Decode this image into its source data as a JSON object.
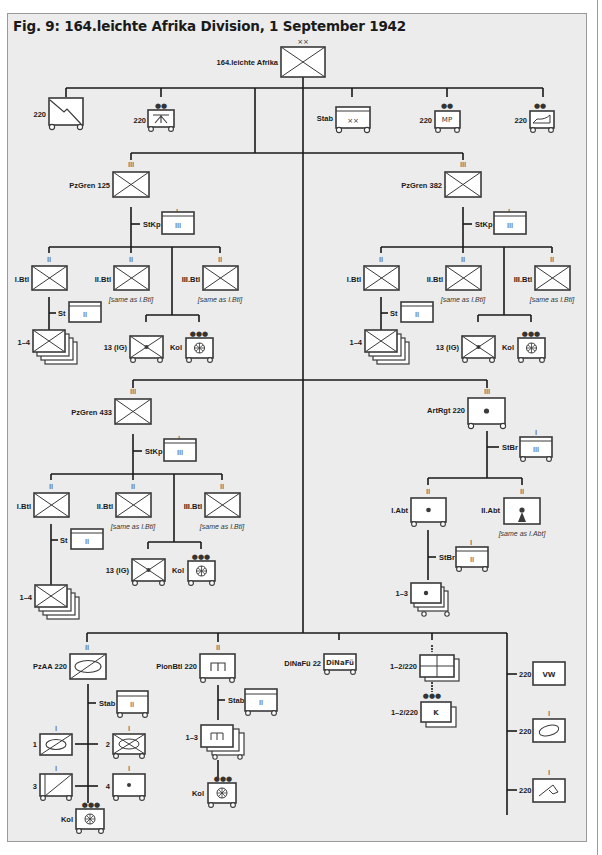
{
  "title": "Fig. 9: 164.leichte Afrika Division, 1 September 1942",
  "colors": {
    "background": "#ececec",
    "frame": "#9a9a9a",
    "line": "#1a1a1a",
    "box_fill": "#ffffff"
  },
  "echelons": {
    "division": "××",
    "regiment": "III",
    "battalion": "II",
    "company": "I",
    "column": "●●●",
    "platoon": "●●"
  },
  "top": {
    "division": {
      "label": "164.leichte Afrika",
      "echelon": "××"
    },
    "signals": {
      "label": "220",
      "icon": "signals-icon"
    },
    "aa_platoon": {
      "label": "220",
      "icon": "anti-aircraft-icon"
    },
    "stab": {
      "label": "Stab",
      "inner": "××"
    },
    "mp": {
      "label": "220",
      "inner": "MP"
    },
    "cartography": {
      "label": "220",
      "icon": "map-shoe-icon"
    }
  },
  "regiments": [
    {
      "label": "PzGren 125",
      "stkp": "StKp",
      "stkp_inner": "III",
      "bns": [
        {
          "label": "I.Btl"
        },
        {
          "label": "II.Btl",
          "note": "[same as I.Btl]"
        },
        {
          "label": "III.Btl",
          "note": "[same as I.Btl]"
        }
      ],
      "st": "St",
      "st_inner": "II",
      "cos": "1–4",
      "ig": "13 (IG)",
      "kol": "Kol"
    },
    {
      "label": "PzGren 382",
      "stkp": "StKp",
      "stkp_inner": "III",
      "bns": [
        {
          "label": "I.Btl"
        },
        {
          "label": "II.Btl",
          "note": "[same as I.Btl]"
        },
        {
          "label": "III.Btl",
          "note": "[same as I.Btl]"
        }
      ],
      "st": "St",
      "st_inner": "II",
      "cos": "1–4",
      "ig": "13 (IG)",
      "kol": "Kol"
    },
    {
      "label": "PzGren 433",
      "stkp": "StKp",
      "stkp_inner": "III",
      "bns": [
        {
          "label": "I.Btl"
        },
        {
          "label": "II.Btl",
          "note": "[same as I.Btl]"
        },
        {
          "label": "III.Btl",
          "note": "[same as I.Btl]"
        }
      ],
      "st": "St",
      "st_inner": "II",
      "cos": "1–4",
      "ig": "13 (IG)",
      "kol": "Kol"
    }
  ],
  "artillery": {
    "label": "ArtRgt 220",
    "stbr": "StBr",
    "stbr_inner": "III",
    "abt1": {
      "label": "I.Abt"
    },
    "abt2": {
      "label": "II.Abt",
      "note": "[same as I.Abt]"
    },
    "abt_stbr": "StBr",
    "abt_stbr_inner": "II",
    "batteries": "1–3"
  },
  "recon": {
    "label": "PzAA 220",
    "stab": "Stab",
    "stab_inner": "II",
    "c1": "1",
    "c2": "2",
    "c3": "3",
    "c4": "4",
    "kol": "Kol"
  },
  "pioneer": {
    "label": "PionBtl 220",
    "stab": "Stab",
    "stab_inner": "II",
    "cos": "1–3",
    "kol": "Kol"
  },
  "signals_commander": {
    "label": "DiNaFü 22",
    "inner": "DiNaFü"
  },
  "supply": {
    "label1": "1–2/220",
    "label2": "1–2/220",
    "k_inner": "K"
  },
  "services": [
    {
      "label": "220",
      "inner": "VW"
    },
    {
      "label": "220",
      "icon": "bakery-icon"
    },
    {
      "label": "220",
      "icon": "veterinary-icon"
    }
  ]
}
